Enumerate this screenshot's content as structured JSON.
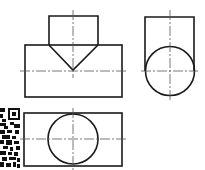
{
  "drawing": {
    "type": "orthographic-projection",
    "views": [
      {
        "name": "front-view",
        "description": "T-shaped body: upper pentagon-like block with V-notch meeting horizontal bar",
        "outline_color": "#1a1a1a",
        "centerline_color": "#555555"
      },
      {
        "name": "side-view",
        "description": "Rectangle with inscribed circle at bottom"
      },
      {
        "name": "top-view",
        "description": "Rectangle with centered circle"
      }
    ]
  },
  "qr_code": {
    "visible": true,
    "partial": true
  }
}
